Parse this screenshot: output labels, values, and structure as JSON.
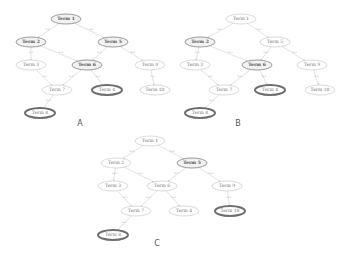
{
  "panels": [
    {
      "label": "A",
      "label_pos": [
        80,
        126
      ],
      "nodes": [
        {
          "id": "1",
          "text": "Term 1",
          "x": 66,
          "y": 19,
          "style": "bold"
        },
        {
          "id": "2",
          "text": "Term 2",
          "x": 31,
          "y": 42,
          "style": "bold"
        },
        {
          "id": "5",
          "text": "Term 5",
          "x": 113,
          "y": 42,
          "style": "bold"
        },
        {
          "id": "3",
          "text": "Term 3",
          "x": 31,
          "y": 65,
          "style": "normal"
        },
        {
          "id": "6",
          "text": "Term 6",
          "x": 87,
          "y": 65,
          "style": "bold"
        },
        {
          "id": "9",
          "text": "Term 9",
          "x": 150,
          "y": 65,
          "style": "normal"
        },
        {
          "id": "7",
          "text": "Term 7",
          "x": 57,
          "y": 90,
          "style": "normal"
        },
        {
          "id": "4",
          "text": "Term 4",
          "x": 107,
          "y": 90,
          "style": "highlight"
        },
        {
          "id": "10",
          "text": "Term 10",
          "x": 155,
          "y": 90,
          "style": "normal"
        },
        {
          "id": "8",
          "text": "Term 8",
          "x": 40,
          "y": 113,
          "style": "highlight"
        }
      ]
    },
    {
      "label": "B",
      "label_pos": [
        238,
        126
      ],
      "nodes": [
        {
          "id": "1",
          "text": "Term 1",
          "x": 241,
          "y": 19,
          "style": "normal"
        },
        {
          "id": "2",
          "text": "Term 2",
          "x": 200,
          "y": 42,
          "style": "bold"
        },
        {
          "id": "5",
          "text": "Term 5",
          "x": 275,
          "y": 42,
          "style": "normal"
        },
        {
          "id": "3",
          "text": "Term 3",
          "x": 195,
          "y": 65,
          "style": "normal"
        },
        {
          "id": "6",
          "text": "Term 6",
          "x": 257,
          "y": 65,
          "style": "bold"
        },
        {
          "id": "9",
          "text": "Term 9",
          "x": 312,
          "y": 65,
          "style": "normal"
        },
        {
          "id": "7",
          "text": "Term 7",
          "x": 224,
          "y": 90,
          "style": "normal"
        },
        {
          "id": "4",
          "text": "Term 4",
          "x": 270,
          "y": 90,
          "style": "highlight"
        },
        {
          "id": "10",
          "text": "Term 10",
          "x": 320,
          "y": 90,
          "style": "normal"
        },
        {
          "id": "8",
          "text": "Term 8",
          "x": 200,
          "y": 113,
          "style": "highlight"
        }
      ]
    },
    {
      "label": "C",
      "label_pos": [
        157,
        246
      ],
      "nodes": [
        {
          "id": "1",
          "text": "Term 1",
          "x": 150,
          "y": 141,
          "style": "normal"
        },
        {
          "id": "2",
          "text": "Term 2",
          "x": 116,
          "y": 163,
          "style": "normal"
        },
        {
          "id": "5",
          "text": "Term 5",
          "x": 192,
          "y": 163,
          "style": "bold"
        },
        {
          "id": "3",
          "text": "Term 3",
          "x": 113,
          "y": 186,
          "style": "normal"
        },
        {
          "id": "6",
          "text": "Term 6",
          "x": 162,
          "y": 186,
          "style": "normal"
        },
        {
          "id": "9",
          "text": "Term 9",
          "x": 227,
          "y": 186,
          "style": "normal"
        },
        {
          "id": "7",
          "text": "Term 7",
          "x": 136,
          "y": 211,
          "style": "normal"
        },
        {
          "id": "4",
          "text": "Term 4",
          "x": 184,
          "y": 211,
          "style": "normal"
        },
        {
          "id": "10",
          "text": "Term 10",
          "x": 230,
          "y": 211,
          "style": "highlight"
        },
        {
          "id": "8",
          "text": "Term 8",
          "x": 113,
          "y": 235,
          "style": "highlight"
        }
      ]
    }
  ],
  "edges": [
    [
      "1",
      "2"
    ],
    [
      "1",
      "5"
    ],
    [
      "2",
      "3"
    ],
    [
      "2",
      "6"
    ],
    [
      "5",
      "6"
    ],
    [
      "5",
      "9"
    ],
    [
      "3",
      "7"
    ],
    [
      "6",
      "7"
    ],
    [
      "6",
      "4"
    ],
    [
      "9",
      "10"
    ],
    [
      "7",
      "8"
    ]
  ],
  "edge_label": "is-a"
}
